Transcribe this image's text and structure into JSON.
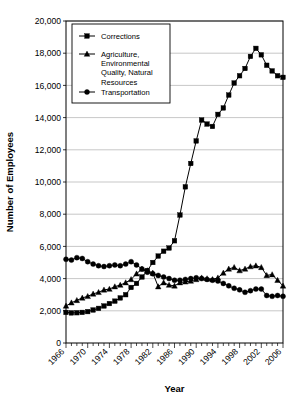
{
  "chart_data": {
    "type": "line",
    "title": "",
    "xlabel": "Year",
    "ylabel": "Number of Employees",
    "xlim": [
      1966,
      2006
    ],
    "ylim": [
      0,
      20000
    ],
    "ytick_step": 2000,
    "xtick_step": 4,
    "minor_xtick_step": 1,
    "grid": "horizontal",
    "legend_position": "top-left-inside",
    "ytick_labels": [
      "0",
      "2,000",
      "4,000",
      "6,000",
      "8,000",
      "10,000",
      "12,000",
      "14,000",
      "16,000",
      "18,000",
      "20,000"
    ],
    "xtick_labels": [
      "1966",
      "1970",
      "1974",
      "1978",
      "1982",
      "1986",
      "1990",
      "1994",
      "1998",
      "2002",
      "2006"
    ],
    "x": [
      1966,
      1967,
      1968,
      1969,
      1970,
      1971,
      1972,
      1973,
      1974,
      1975,
      1976,
      1977,
      1978,
      1979,
      1980,
      1981,
      1982,
      1983,
      1984,
      1985,
      1986,
      1987,
      1988,
      1989,
      1990,
      1991,
      1992,
      1993,
      1994,
      1995,
      1996,
      1997,
      1998,
      1999,
      2000,
      2001,
      2002,
      2003,
      2004,
      2005,
      2006
    ],
    "series": [
      {
        "name": "Corrections",
        "marker": "square",
        "values": [
          1900,
          1870,
          1880,
          1900,
          1950,
          2050,
          2150,
          2300,
          2450,
          2600,
          2800,
          3000,
          3450,
          3700,
          4100,
          4500,
          5000,
          5400,
          5700,
          5900,
          6350,
          7950,
          9700,
          11150,
          12550,
          13850,
          13600,
          13450,
          14200,
          14600,
          15400,
          16150,
          16600,
          17050,
          17800,
          18300,
          17900,
          17250,
          16900,
          16600,
          16500
        ]
      },
      {
        "name": "Agriculture, Environmental Quality, Natural Resources",
        "marker": "triangle",
        "values": [
          2300,
          2500,
          2650,
          2800,
          2900,
          3050,
          3150,
          3300,
          3350,
          3500,
          3600,
          3750,
          3950,
          4300,
          4600,
          4500,
          4350,
          3500,
          3750,
          3600,
          3550,
          3750,
          3800,
          3850,
          3950,
          4050,
          4000,
          3950,
          4050,
          4350,
          4600,
          4700,
          4500,
          4600,
          4750,
          4800,
          4700,
          4200,
          4250,
          3900,
          3550
        ]
      },
      {
        "name": "Transportation",
        "marker": "circle",
        "values": [
          5200,
          5150,
          5300,
          5250,
          5050,
          4900,
          4800,
          4750,
          4800,
          4850,
          4800,
          4900,
          5050,
          4850,
          4600,
          4400,
          4300,
          4200,
          4100,
          4000,
          3900,
          3900,
          3950,
          4000,
          4050,
          4000,
          3950,
          3900,
          3850,
          3700,
          3550,
          3400,
          3300,
          3150,
          3250,
          3350,
          3350,
          2950,
          2900,
          2950,
          2900
        ]
      }
    ]
  }
}
